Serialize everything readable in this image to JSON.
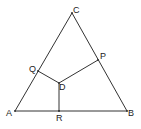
{
  "diagram": {
    "type": "geometry",
    "colors": {
      "line": "#333333",
      "text": "#222222",
      "background": "#ffffff"
    },
    "points": {
      "A": {
        "label": "A",
        "x": 15,
        "y": 111,
        "lx": 6,
        "ly": 116
      },
      "B": {
        "label": "B",
        "x": 127,
        "y": 111,
        "lx": 128,
        "ly": 116
      },
      "C": {
        "label": "C",
        "x": 72,
        "y": 13,
        "lx": 73,
        "ly": 13
      },
      "P": {
        "label": "P",
        "x": 98,
        "y": 60,
        "lx": 100,
        "ly": 59
      },
      "Q": {
        "label": "Q",
        "x": 38,
        "y": 71,
        "lx": 29,
        "ly": 72
      },
      "D": {
        "label": "D",
        "x": 59,
        "y": 83,
        "lx": 59,
        "ly": 90
      },
      "R": {
        "label": "R",
        "x": 59,
        "y": 111,
        "lx": 56,
        "ly": 121
      }
    },
    "segments": [
      [
        "A",
        "B"
      ],
      [
        "B",
        "C"
      ],
      [
        "C",
        "A"
      ],
      [
        "D",
        "P"
      ],
      [
        "D",
        "Q"
      ],
      [
        "D",
        "R"
      ]
    ]
  }
}
